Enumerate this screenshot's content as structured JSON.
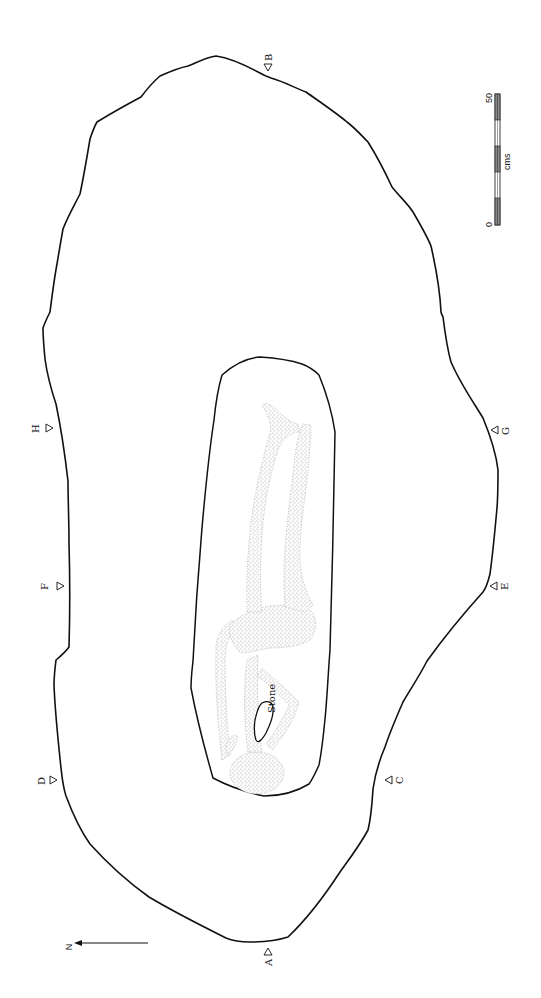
{
  "figure": {
    "type": "archaeological grave plan",
    "orientation": "rotated 90 degrees (north points left)"
  },
  "north_arrow": {
    "label": "N"
  },
  "section_markers": [
    {
      "id": "A",
      "label": "A"
    },
    {
      "id": "B",
      "label": "B"
    },
    {
      "id": "C",
      "label": "C"
    },
    {
      "id": "D",
      "label": "D"
    },
    {
      "id": "E",
      "label": "E"
    },
    {
      "id": "F",
      "label": "F"
    },
    {
      "id": "G",
      "label": "G"
    },
    {
      "id": "H",
      "label": "H"
    }
  ],
  "annotations": {
    "stone": "Stone"
  },
  "scale_bar": {
    "min_label": "0",
    "max_label": "50",
    "unit": "cms"
  },
  "colors": {
    "line": "#111111",
    "background": "#ffffff",
    "stipple": "#555555"
  }
}
